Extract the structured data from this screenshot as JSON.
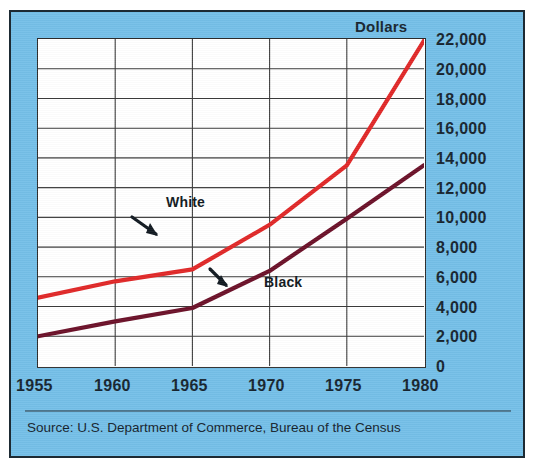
{
  "top_partial_text": "",
  "axis": {
    "y_title": "Dollars",
    "y_ticks": [
      "22,000",
      "20,000",
      "18,000",
      "16,000",
      "14,000",
      "12,000",
      "10,000",
      "8,000",
      "6,000",
      "4,000",
      "2,000",
      "0"
    ],
    "x_ticks": [
      "1955",
      "1960",
      "1965",
      "1970",
      "1975",
      "1980"
    ]
  },
  "labels": {
    "white": "White",
    "black": "Black"
  },
  "source": "Source: U.S. Department of Commerce, Bureau of the Census",
  "colors": {
    "panel_background": "#74bfe8",
    "plot_background": "#ffffff",
    "white_series": "#e02727",
    "black_series": "#6b1028",
    "text": "#16242f",
    "border": "#1d2a33"
  },
  "chart_data": {
    "type": "line",
    "title": "",
    "subtitle": "",
    "xlabel": "",
    "ylabel": "Dollars",
    "xlim": [
      1955,
      1980
    ],
    "ylim": [
      0,
      22000
    ],
    "ytick_step": 2000,
    "grid": true,
    "legend": "inline-annotations",
    "x": [
      1955,
      1960,
      1965,
      1970,
      1975,
      1980
    ],
    "series": [
      {
        "name": "White",
        "color": "#e02727",
        "values": [
          4600,
          5700,
          6500,
          9500,
          13500,
          21900
        ]
      },
      {
        "name": "Black",
        "color": "#6b1028",
        "values": [
          2000,
          3000,
          3900,
          6400,
          9900,
          13500
        ]
      }
    ],
    "annotations": [
      {
        "text": "White",
        "points_to_series": "White",
        "points_to_x": 1970
      },
      {
        "text": "Black",
        "points_to_series": "Black",
        "points_to_x": 1972
      }
    ]
  }
}
